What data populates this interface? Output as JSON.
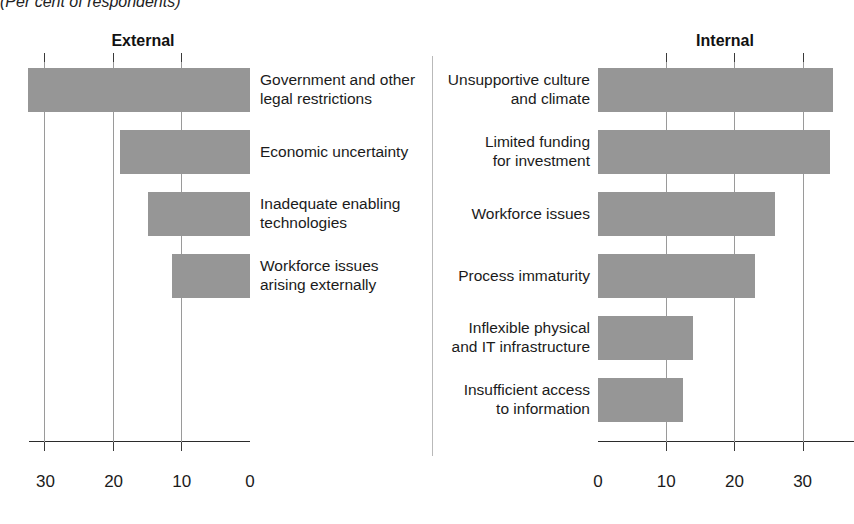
{
  "subtitle": "(Per cent of respondents)",
  "divider": "panel-divider",
  "colors": {
    "bar": "#969696",
    "axis": "#2b2b2b",
    "grid": "#9a9a9a",
    "text": "#1b1b1b"
  },
  "chart_data": {
    "type": "bar",
    "orientation": "horizontal",
    "title": "(Per cent of respondents)",
    "xlabel": "",
    "ylabel": "",
    "grid": true,
    "legend": "none",
    "panels": [
      {
        "name": "External",
        "title": "External",
        "direction": "right-to-left",
        "xlim": [
          0,
          32.5
        ],
        "ticks": [
          30,
          20,
          10,
          0
        ],
        "tick_labels": [
          "30",
          "20",
          "10",
          "0"
        ],
        "categories": [
          "Government and other legal restrictions",
          "Economic uncertainty",
          "Inadequate enabling technologies",
          "Workforce issues arising externally"
        ],
        "category_lines": [
          [
            "Government and other",
            "legal restrictions"
          ],
          [
            "Economic uncertainty"
          ],
          [
            "Inadequate enabling",
            "technologies"
          ],
          [
            "Workforce issues",
            "arising externally"
          ]
        ],
        "values": [
          32.5,
          19,
          15,
          11.5
        ]
      },
      {
        "name": "Internal",
        "title": "Internal",
        "direction": "left-to-right",
        "xlim": [
          0,
          36
        ],
        "ticks": [
          0,
          10,
          20,
          30
        ],
        "tick_labels": [
          "0",
          "10",
          "20",
          "30"
        ],
        "categories": [
          "Unsupportive culture and climate",
          "Limited funding for investment",
          "Workforce issues",
          "Process immaturity",
          "Inflexible physical and IT infrastructure",
          "Insufficient access to information"
        ],
        "category_lines": [
          [
            "Unsupportive culture",
            "and climate"
          ],
          [
            "Limited funding",
            "for investment"
          ],
          [
            "Workforce issues"
          ],
          [
            "Process immaturity"
          ],
          [
            "Inflexible physical",
            "and IT infrastructure"
          ],
          [
            "Insufficient access",
            "to information"
          ]
        ],
        "values": [
          34.5,
          34,
          26,
          23,
          14,
          12.5
        ]
      }
    ]
  }
}
